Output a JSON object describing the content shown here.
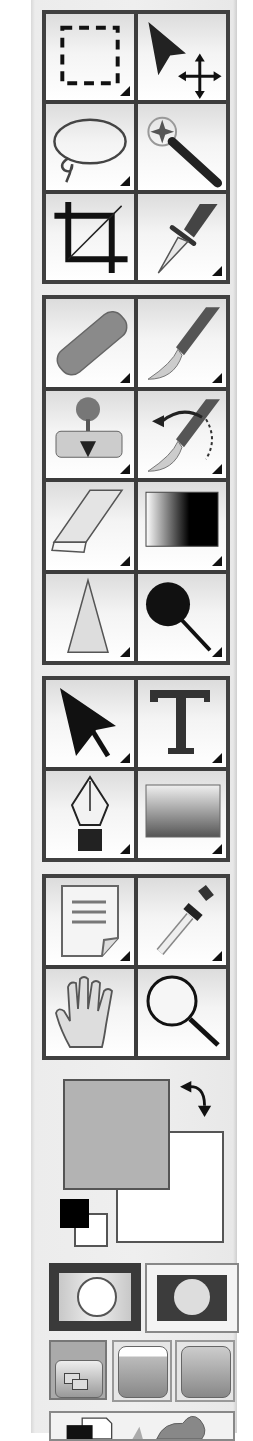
{
  "toolbox": {
    "groups": [
      {
        "name": "selection",
        "tools": [
          {
            "id": "rectangular-marquee",
            "icon": "marquee-rect-icon",
            "has_submenu": true
          },
          {
            "id": "move",
            "icon": "move-icon",
            "has_submenu": false
          },
          {
            "id": "lasso",
            "icon": "lasso-icon",
            "has_submenu": true
          },
          {
            "id": "magic-wand",
            "icon": "magic-wand-icon",
            "has_submenu": false
          },
          {
            "id": "crop",
            "icon": "crop-icon",
            "has_submenu": false
          },
          {
            "id": "slice",
            "icon": "slice-knife-icon",
            "has_submenu": true
          }
        ]
      },
      {
        "name": "painting",
        "tools": [
          {
            "id": "healing-brush",
            "icon": "bandage-icon",
            "has_submenu": true
          },
          {
            "id": "brush",
            "icon": "paintbrush-icon",
            "has_submenu": true
          },
          {
            "id": "clone-stamp",
            "icon": "stamp-icon",
            "has_submenu": true
          },
          {
            "id": "history-brush",
            "icon": "history-brush-icon",
            "has_submenu": true
          },
          {
            "id": "eraser",
            "icon": "eraser-icon",
            "has_submenu": true
          },
          {
            "id": "gradient",
            "icon": "gradient-icon",
            "has_submenu": true
          },
          {
            "id": "blur",
            "icon": "blur-drop-icon",
            "has_submenu": true
          },
          {
            "id": "dodge",
            "icon": "dodge-icon",
            "has_submenu": true
          }
        ]
      },
      {
        "name": "vector",
        "tools": [
          {
            "id": "path-selection",
            "icon": "path-select-arrow-icon",
            "has_submenu": true
          },
          {
            "id": "type",
            "icon": "type-t-icon",
            "has_submenu": true
          },
          {
            "id": "pen",
            "icon": "pen-nib-icon",
            "has_submenu": true
          },
          {
            "id": "rectangle-shape",
            "icon": "rectangle-shape-icon",
            "has_submenu": true
          }
        ]
      },
      {
        "name": "navigation",
        "tools": [
          {
            "id": "notes",
            "icon": "note-icon",
            "has_submenu": true
          },
          {
            "id": "eyedropper",
            "icon": "eyedropper-icon",
            "has_submenu": true
          },
          {
            "id": "hand",
            "icon": "hand-icon",
            "has_submenu": false
          },
          {
            "id": "zoom",
            "icon": "magnifier-icon",
            "has_submenu": false
          }
        ]
      }
    ],
    "colors": {
      "foreground": "#b3b3b3",
      "background": "#ffffff",
      "default_fg": "#000000",
      "default_bg": "#ffffff",
      "swap_icon": "swap-arrow-icon"
    },
    "mask_modes": [
      {
        "id": "standard-mode",
        "icon": "standard-mode-icon",
        "active": true
      },
      {
        "id": "quick-mask-mode",
        "icon": "quick-mask-icon",
        "active": false
      }
    ],
    "screen_modes": [
      {
        "id": "standard-screen-mode",
        "icon": "standard-screen-icon",
        "active": true
      },
      {
        "id": "full-screen-menu-mode",
        "icon": "full-screen-menu-icon",
        "active": false
      },
      {
        "id": "full-screen-mode",
        "icon": "full-screen-icon",
        "active": false
      }
    ],
    "jump_to": {
      "id": "jump-to-imageready",
      "icon": "jump-to-icon"
    }
  }
}
